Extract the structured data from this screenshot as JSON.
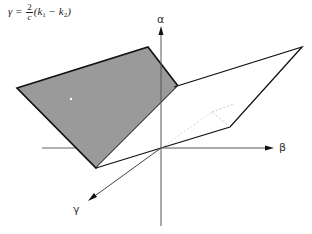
{
  "formula": {
    "lhs": "γ",
    "eq": "=",
    "numerator": "2",
    "denominator": "c",
    "open": "(k",
    "sub1": "1",
    "minus": " − k",
    "sub2": "2",
    "close": ")"
  },
  "axes": {
    "alpha": "α",
    "beta": "β",
    "gamma": "γ"
  },
  "colors": {
    "shaded_plane": "#9a9a9a",
    "lines": "#111111",
    "axes": "#555555"
  }
}
